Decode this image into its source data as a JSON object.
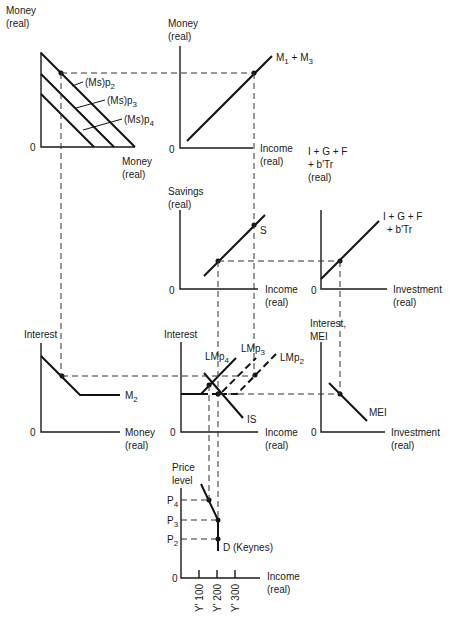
{
  "colors": {
    "ink": "#111111",
    "background": "#ffffff"
  },
  "panels": {
    "money_supply": {
      "y_label": [
        "Money",
        "(real)"
      ],
      "x_label": [
        "Money",
        "(real)"
      ],
      "origin": "0",
      "curves": [
        "(Ms)p",
        "(Ms)p",
        "(Ms)p"
      ],
      "curve_subs": [
        "2",
        "3",
        "4"
      ]
    },
    "transactions_demand": {
      "y_label": [
        "Money",
        "(real)"
      ],
      "x_label": [
        "Income",
        "(real)"
      ],
      "origin": "0",
      "curve": "M",
      "curve_sub1": "1",
      "curve_mid": " + M",
      "curve_sub2": "3"
    },
    "savings": {
      "y_label": [
        "Savings",
        "(real)"
      ],
      "x_label": [
        "Income",
        "(real)"
      ],
      "origin": "0",
      "curve": "S"
    },
    "investment_injections": {
      "y_label": [
        "I + G + F",
        "+ b'Tr",
        "(real)"
      ],
      "x_label": [
        "Investment",
        "(real)"
      ],
      "origin": "0",
      "curve": [
        "I + G + F",
        "+ b'Tr"
      ]
    },
    "liquidity_preference": {
      "y_label": [
        "Interest"
      ],
      "x_label": [
        "Money",
        "(real)"
      ],
      "origin": "0",
      "curve": "M",
      "curve_sub": "2"
    },
    "is_lm": {
      "y_label": [
        "Interest"
      ],
      "x_label": [
        "Income",
        "(real)"
      ],
      "origin": "0",
      "lm_curves": [
        "LMp",
        "LMp",
        "LMp"
      ],
      "lm_subs": [
        "4",
        "3",
        "2"
      ],
      "is_curve": "IS"
    },
    "mei": {
      "y_label": [
        "Interest,",
        "MEI"
      ],
      "x_label": [
        "Investment",
        "(real)"
      ],
      "origin": "0",
      "curve": "MEI"
    },
    "aggregate_demand": {
      "y_label": [
        "Price",
        "level"
      ],
      "x_label": [
        "Income",
        "(real)"
      ],
      "origin": "0",
      "price_levels": [
        "P",
        "P",
        "P"
      ],
      "price_subs": [
        "4",
        "3",
        "2"
      ],
      "curve": "D  (Keynes)",
      "x_ticks": [
        "Y' 100",
        "Y' 200",
        "Y' 300"
      ]
    }
  }
}
